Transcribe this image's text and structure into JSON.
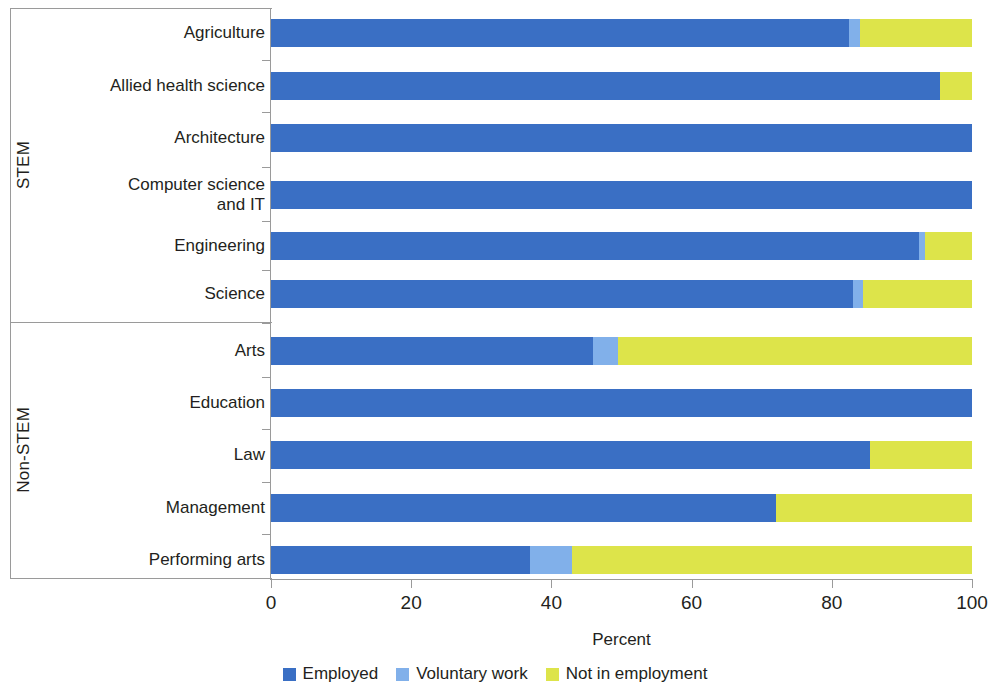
{
  "chart_data": {
    "type": "bar",
    "orientation": "horizontal",
    "stacked": true,
    "title": "",
    "xlabel": "Percent",
    "ylabel": "",
    "xlim": [
      0,
      100
    ],
    "xticks": [
      0,
      20,
      40,
      60,
      80,
      100
    ],
    "grid": false,
    "legend_position": "bottom",
    "categories": [
      "Agriculture",
      "Allied health science",
      "Architecture",
      "Computer science\nand IT",
      "Engineering",
      "Science",
      "Arts",
      "Education",
      "Law",
      "Management",
      "Performing arts"
    ],
    "groups": [
      {
        "label": "STEM",
        "categories": [
          "Agriculture",
          "Allied health science",
          "Architecture",
          "Computer science\nand IT",
          "Engineering",
          "Science"
        ]
      },
      {
        "label": "Non-STEM",
        "categories": [
          "Arts",
          "Education",
          "Law",
          "Management",
          "Performing arts"
        ]
      }
    ],
    "series": [
      {
        "name": "Employed",
        "color": "#3a6fc4",
        "values": [
          82.5,
          95.5,
          100.0,
          100.0,
          92.5,
          83.0,
          46.0,
          100.0,
          85.5,
          72.0,
          37.0
        ]
      },
      {
        "name": "Voluntary work",
        "color": "#81b0ea",
        "values": [
          1.5,
          0.0,
          0.0,
          0.0,
          0.8,
          1.5,
          3.5,
          0.0,
          0.0,
          0.0,
          6.0
        ]
      },
      {
        "name": "Not in employment",
        "color": "#dde44a",
        "values": [
          16.0,
          4.5,
          0.0,
          0.0,
          6.7,
          15.5,
          50.5,
          0.0,
          14.5,
          28.0,
          57.0
        ]
      }
    ]
  },
  "axis": {
    "x_title": "Percent",
    "tick_labels": [
      "0",
      "20",
      "40",
      "60",
      "80",
      "100"
    ]
  },
  "legend": {
    "items": [
      {
        "label": "Employed",
        "color": "#3a6fc4"
      },
      {
        "label": "Voluntary work",
        "color": "#81b0ea"
      },
      {
        "label": "Not in employment",
        "color": "#dde44a"
      }
    ]
  },
  "groups": {
    "stem_label": "STEM",
    "nonstem_label": "Non-STEM"
  }
}
